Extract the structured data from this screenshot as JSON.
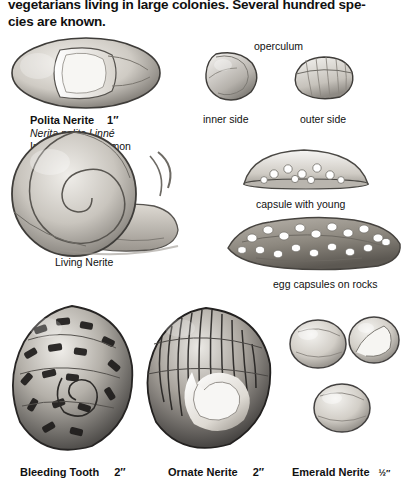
{
  "page": {
    "intro_text": "vegetarians living in large colonies. Several hundred spe-cies are known.",
    "intro_line1": "vegetarians living in large colonies. Several hundred spe-",
    "intro_line2": "cies are known."
  },
  "figures": [
    {
      "id": "polita-nerite-shell",
      "name_bold": "Polita Nerite",
      "size": "1″",
      "italic": "Nerita polita Linné",
      "note": "Indo-Pacific; common"
    },
    {
      "id": "operculum-inner",
      "label": "inner side"
    },
    {
      "id": "operculum-outer",
      "label": "outer side"
    },
    {
      "id": "operculum-group",
      "label": "operculum"
    },
    {
      "id": "capsule-with-young",
      "label": "capsule with young"
    },
    {
      "id": "living-nerite",
      "label": "Living Nerite"
    },
    {
      "id": "egg-capsules-on-rocks",
      "label": "egg capsules on rocks"
    },
    {
      "id": "bleeding-tooth",
      "name_bold": "Bleeding Tooth",
      "size": "2″"
    },
    {
      "id": "ornate-nerite",
      "name_bold": "Ornate Nerite",
      "size": "2″"
    },
    {
      "id": "emerald-nerite",
      "name_bold": "Emerald Nerite",
      "size": "½″"
    }
  ],
  "colors": {
    "ink": "#111111",
    "shell_light": "#e8e6e2",
    "shell_mid": "#b8b4ae",
    "shell_dark": "#4a4846",
    "rock": "#9a948c",
    "page_bg": "#ffffff"
  }
}
